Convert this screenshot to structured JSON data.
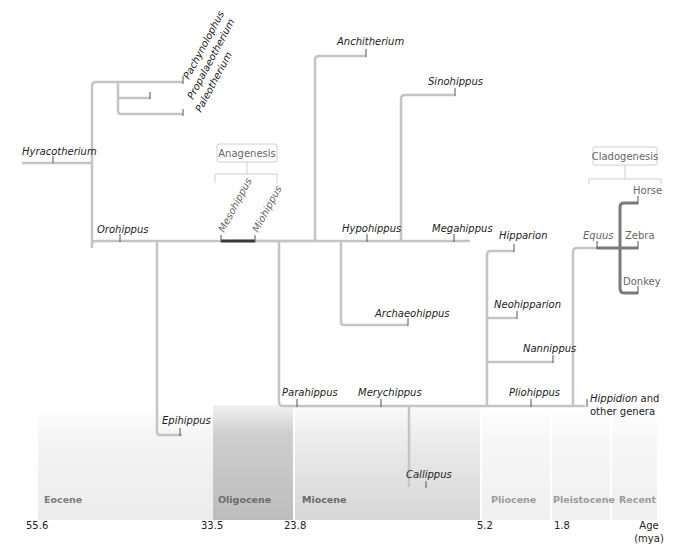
{
  "legend": {
    "anagenesis": "Anagenesis",
    "cladogenesis": "Cladogenesis"
  },
  "taxa": {
    "hyracotherium": "Hyracotherium",
    "pachynolophus": "Pachynolophus",
    "propalaeotherium": "Propalaeotherium",
    "paleotherium": "Paleotherium",
    "orohippus": "Orohippus",
    "mesohippus": "Mesohippus",
    "miohippus": "Miohippus",
    "epihippus": "Epihippus",
    "anchitherium": "Anchitherium",
    "sinohippus": "Sinohippus",
    "hypohippus": "Hypohippus",
    "megahippus": "Megahippus",
    "archaeohippus": "Archaeohippus",
    "parahippus": "Parahippus",
    "merychippus": "Merychippus",
    "callippus": "Callippus",
    "hipparion": "Hipparion",
    "neohipparion": "Neohipparion",
    "nannippus": "Nannippus",
    "pliohippus": "Pliohippus",
    "hippidion": "Hippidion",
    "hippidion_suffix": " and",
    "other_genera": "other genera",
    "equus": "Equus",
    "horse": "Horse",
    "zebra": "Zebra",
    "donkey": "Donkey"
  },
  "periods": [
    {
      "name": "Eocene",
      "color": "#7a7a7a"
    },
    {
      "name": "Oligocene",
      "color": "#6a6a6a"
    },
    {
      "name": "Miocene",
      "color": "#6a6a6a"
    },
    {
      "name": "Pliocene",
      "color": "#9a9a9a"
    },
    {
      "name": "Pleistocene",
      "color": "#9a9a9a"
    },
    {
      "name": "Recent",
      "color": "#9a9a9a"
    }
  ],
  "ages": [
    "55.6",
    "33.5",
    "23.8",
    "5.2",
    "1.8"
  ],
  "age_label": "Age",
  "age_unit": "(mya)",
  "colors": {
    "branch": "#c4c4c4",
    "anagenesis": "#3a3a3a",
    "cladogenesis": "#7a7a7a"
  }
}
